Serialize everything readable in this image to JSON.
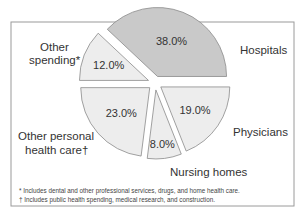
{
  "chart_data": {
    "type": "pie",
    "title": "",
    "slices": [
      {
        "name": "Hospitals",
        "value": 38.0,
        "label": "38.0%",
        "color": "#c9c9c9"
      },
      {
        "name": "Physicians",
        "value": 19.0,
        "label": "19.0%",
        "color": "#ededed"
      },
      {
        "name": "Nursing homes",
        "value": 8.0,
        "label": "8.0%",
        "color": "#ededed"
      },
      {
        "name": "Other personal health care",
        "value": 23.0,
        "label": "23.0%",
        "color": "#ededed"
      },
      {
        "name": "Other spending",
        "value": 12.0,
        "label": "12.0%",
        "color": "#ededed"
      }
    ],
    "category_labels": {
      "hospitals": [
        "Hospitals"
      ],
      "physicians": [
        "Physicians"
      ],
      "nursing": [
        "Nursing homes"
      ],
      "other_personal": [
        "Other personal",
        "health care†"
      ],
      "other_spending": [
        "Other",
        "spending*"
      ]
    },
    "exploded": true,
    "footnotes": [
      "* Includes dental and other professional services, drugs, and home health care.",
      "† Includes public health spending, medical research, and construction."
    ]
  },
  "colors": {
    "frame": "#999999",
    "slice_stroke": "#8a8a8a",
    "text": "#333333"
  }
}
